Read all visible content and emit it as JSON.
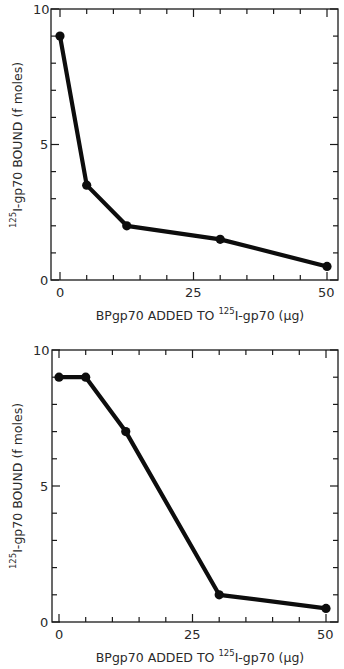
{
  "chart_data": [
    {
      "type": "line",
      "title": "",
      "xlabel": {
        "pre": "BPgp70 ADDED TO ",
        "sup": "125",
        "post": "I-gp70 (µg)"
      },
      "ylabel": {
        "sup": "125",
        "post": "I-gp70 BOUND (f moles)"
      },
      "xlim": [
        0,
        50
      ],
      "ylim": [
        0,
        10
      ],
      "x_ticks": [
        "0",
        "25",
        "50"
      ],
      "y_ticks": [
        "0",
        "5",
        "10"
      ],
      "grid": false,
      "legend": null,
      "series": [
        {
          "name": "binding",
          "x": [
            0,
            5,
            12.5,
            30,
            50
          ],
          "values": [
            9.0,
            3.5,
            2.0,
            1.5,
            0.5
          ]
        }
      ]
    },
    {
      "type": "line",
      "title": "",
      "xlabel": {
        "pre": "BPgp70 ADDED TO ",
        "sup": "125",
        "post": "I-gp70 (µg)"
      },
      "ylabel": {
        "sup": "125",
        "post": "I-gp70 BOUND (f moles)"
      },
      "xlim": [
        0,
        50
      ],
      "ylim": [
        0,
        10
      ],
      "x_ticks": [
        "0",
        "25",
        "50"
      ],
      "y_ticks": [
        "0",
        "5",
        "10"
      ],
      "grid": false,
      "legend": null,
      "series": [
        {
          "name": "binding",
          "x": [
            0,
            5,
            12.5,
            30,
            50
          ],
          "values": [
            9.0,
            9.0,
            7.0,
            1.0,
            0.5
          ]
        }
      ]
    }
  ]
}
